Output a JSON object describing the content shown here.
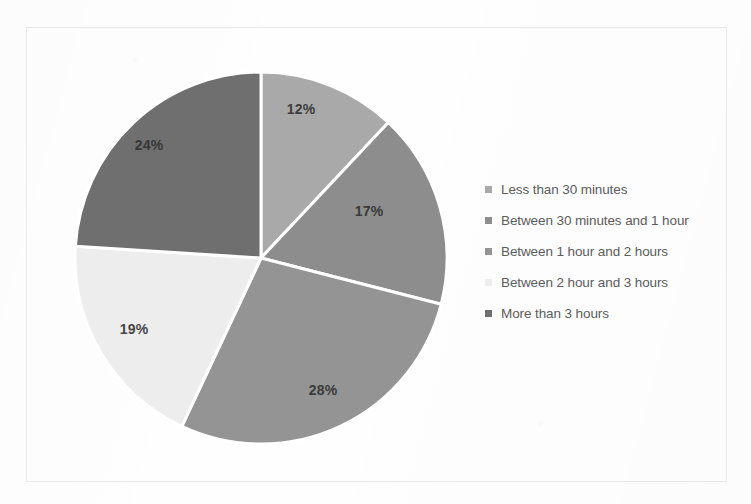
{
  "chart_data": {
    "type": "pie",
    "title": "",
    "labels": [
      "Less than 30 minutes",
      "Between 30 minutes and 1 hour",
      "Between 1 hour and 2 hours",
      "Between 2 hour and 3 hours",
      "More than 3 hours"
    ],
    "values": [
      12,
      17,
      28,
      19,
      24
    ],
    "data_labels": [
      "12%",
      "17%",
      "28%",
      "19%",
      "24%"
    ],
    "units": "percent",
    "colors": [
      "#a9a9a9",
      "#8d8d8d",
      "#949494",
      "#ededed",
      "#6f6f6f"
    ],
    "start_angle_deg": 0,
    "direction": "clockwise",
    "separator_color": "#ffffff",
    "legend_position": "right",
    "grid": false,
    "xlabel": "",
    "ylabel": ""
  },
  "frame": {
    "border_color": "#e9e9e9"
  },
  "legend": {
    "items": [
      {
        "label": "Less than 30 minutes",
        "color": "#a9a9a9"
      },
      {
        "label": "Between 30 minutes and 1 hour",
        "color": "#8d8d8d"
      },
      {
        "label": "Between 1 hour and 2 hours",
        "color": "#949494"
      },
      {
        "label": "Between 2 hour and 3 hours",
        "color": "#ededed"
      },
      {
        "label": "More than 3 hours",
        "color": "#6f6f6f"
      }
    ]
  }
}
